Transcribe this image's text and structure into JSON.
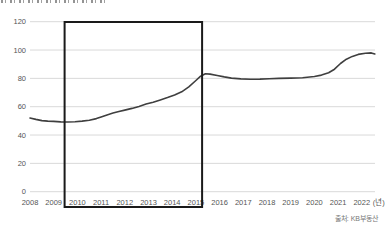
{
  "chart_data": {
    "type": "line",
    "title_clipped_at_top": true,
    "title_visible_text": "",
    "x_ticks": [
      "2008",
      "2009",
      "2010",
      "2011",
      "2012",
      "2013",
      "2014",
      "2015",
      "2016",
      "2017",
      "2018",
      "2019",
      "2020",
      "2021",
      "2022"
    ],
    "x_axis_unit_label": "(년)",
    "y_ticks": [
      0,
      20,
      40,
      60,
      80,
      100,
      120
    ],
    "xlim": [
      2008,
      2022.6
    ],
    "ylim": [
      0,
      120
    ],
    "grid": "horizontal",
    "legend": "none",
    "source": "출처: KB부동산",
    "highlight_box": {
      "x_from_year": 2009.46,
      "x_to_year": 2015.26,
      "covers_full_height_and_x_labels": true
    },
    "series": [
      {
        "name": "price-index",
        "points": [
          [
            2008.0,
            52.0
          ],
          [
            2008.25,
            51.0
          ],
          [
            2008.5,
            50.2
          ],
          [
            2008.75,
            49.8
          ],
          [
            2009.0,
            49.6
          ],
          [
            2009.3,
            49.3
          ],
          [
            2009.6,
            49.2
          ],
          [
            2009.9,
            49.4
          ],
          [
            2010.2,
            49.8
          ],
          [
            2010.5,
            50.4
          ],
          [
            2010.8,
            51.6
          ],
          [
            2011.0,
            52.8
          ],
          [
            2011.25,
            54.2
          ],
          [
            2011.5,
            55.5
          ],
          [
            2011.75,
            56.6
          ],
          [
            2012.0,
            57.6
          ],
          [
            2012.3,
            58.8
          ],
          [
            2012.6,
            60.2
          ],
          [
            2012.9,
            61.8
          ],
          [
            2013.2,
            63.2
          ],
          [
            2013.5,
            64.8
          ],
          [
            2013.8,
            66.4
          ],
          [
            2014.1,
            68.2
          ],
          [
            2014.4,
            70.5
          ],
          [
            2014.7,
            74.0
          ],
          [
            2015.0,
            78.5
          ],
          [
            2015.2,
            81.5
          ],
          [
            2015.4,
            83.3
          ],
          [
            2015.6,
            83.0
          ],
          [
            2015.9,
            82.0
          ],
          [
            2016.2,
            81.0
          ],
          [
            2016.5,
            80.2
          ],
          [
            2016.9,
            79.6
          ],
          [
            2017.3,
            79.4
          ],
          [
            2017.7,
            79.5
          ],
          [
            2018.1,
            79.8
          ],
          [
            2018.5,
            80.0
          ],
          [
            2019.0,
            80.2
          ],
          [
            2019.5,
            80.5
          ],
          [
            2020.0,
            81.3
          ],
          [
            2020.3,
            82.3
          ],
          [
            2020.6,
            84.0
          ],
          [
            2020.85,
            86.5
          ],
          [
            2021.1,
            90.5
          ],
          [
            2021.35,
            93.5
          ],
          [
            2021.6,
            95.5
          ],
          [
            2021.85,
            96.9
          ],
          [
            2022.15,
            97.7
          ],
          [
            2022.4,
            98.0
          ],
          [
            2022.55,
            97.2
          ]
        ]
      }
    ],
    "colors": {
      "line": "#3f3f3f",
      "grid": "#d9d9d9",
      "highlight_box": "#1a1a1a",
      "tick_label": "#555555",
      "source_text": "#777777",
      "background": "#ffffff"
    }
  }
}
